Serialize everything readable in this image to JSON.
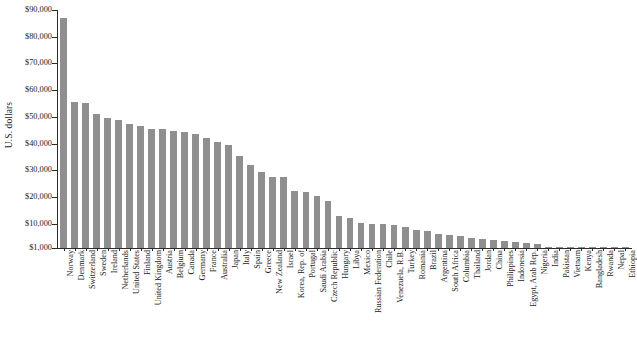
{
  "chart_data": {
    "type": "bar",
    "title": "",
    "xlabel": "",
    "ylabel": "U.S. dollars",
    "ylim": [
      1000,
      90000
    ],
    "ytick_values": [
      90000,
      80000,
      70000,
      60000,
      50000,
      40000,
      30000,
      20000,
      10000,
      1000
    ],
    "ytick_labels": [
      "$90,000",
      "$80,000",
      "$70,000",
      "$60,000",
      "$50,000",
      "$40,000",
      "$30,000",
      "$20,000",
      "$10,000",
      "$1,000"
    ],
    "grid": false,
    "legend": null,
    "bar_color": "#8f8f8f",
    "axis_color": "#2b2b2b",
    "categories": [
      "Norway",
      "Denmark",
      "Switzerland",
      "Sweden",
      "Ireland",
      "Netherlands",
      "United States",
      "Finland",
      "United Kingdom",
      "Austria",
      "Belgium",
      "Canada",
      "Germany",
      "France",
      "Australia",
      "Japan",
      "Italy",
      "Spain",
      "Greece",
      "New Zealand",
      "Israel",
      "Korea, Rep. of",
      "Portugal",
      "Saudi Arabia",
      "Czech Republic",
      "Hungary",
      "Libya",
      "Mexico",
      "Russian Federation",
      "Chile",
      "Venezuela, R.B.",
      "Turkey",
      "Romania",
      "Brazil",
      "Argentina",
      "South Africa",
      "Columbia",
      "Thailand",
      "Jordan",
      "China",
      "Philippines",
      "Indonesia",
      "Egypt, Arab Rep.",
      "Nigeria",
      "India",
      "Pakistan",
      "Vietnam",
      "Kenya",
      "Bangladesh",
      "Rwanda",
      "Nepal",
      "Ethiopia"
    ],
    "values": [
      87000,
      55600,
      55300,
      51000,
      49700,
      48800,
      47200,
      46500,
      45600,
      45400,
      44600,
      44500,
      43600,
      42000,
      40800,
      39500,
      35300,
      32000,
      29500,
      27700,
      27400,
      22500,
      21800,
      20500,
      18400,
      13000,
      12400,
      10200,
      10000,
      9800,
      9600,
      8900,
      7800,
      7500,
      6400,
      5800,
      5500,
      4600,
      4200,
      4100,
      3600,
      3200,
      2700,
      2400,
      1500,
      1300,
      1200,
      1000,
      750,
      600,
      520,
      420
    ]
  }
}
